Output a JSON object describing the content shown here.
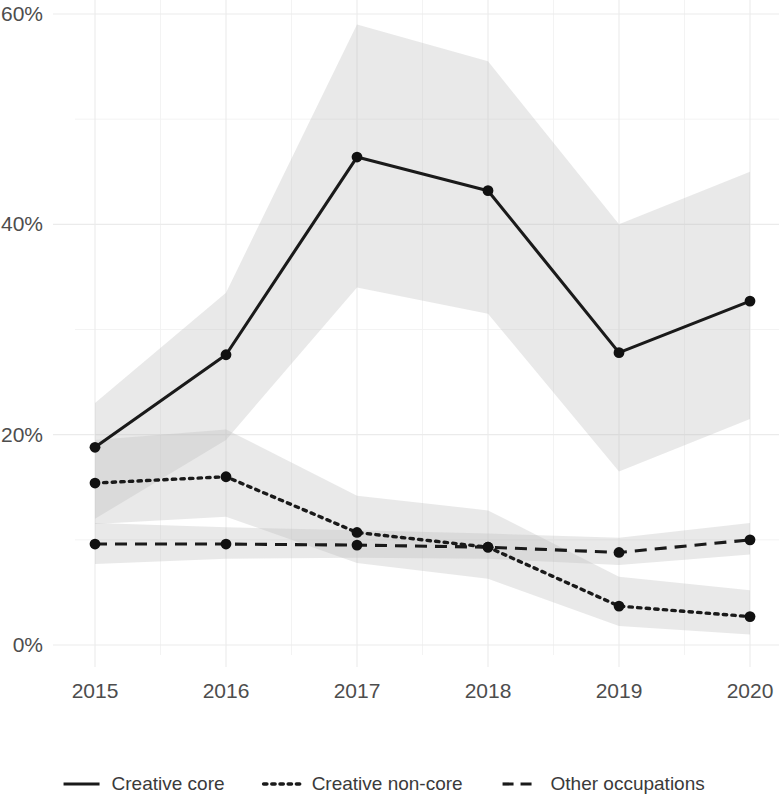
{
  "chart_data": {
    "type": "line",
    "title": "",
    "subtitle": "",
    "xlabel": "",
    "ylabel": "",
    "categories": [
      "2015",
      "2016",
      "2017",
      "2018",
      "2019",
      "2020"
    ],
    "x": [
      2015,
      2016,
      2017,
      2018,
      2019,
      2020
    ],
    "ylim": [
      0,
      60
    ],
    "ytick_labels": [
      "0%",
      "20%",
      "40%",
      "60%"
    ],
    "ytick_values": [
      0,
      20,
      40,
      60
    ],
    "xtick_labels": [
      "2015",
      "2016",
      "2017",
      "2018",
      "2019",
      "2020"
    ],
    "grid": true,
    "grid_minor": true,
    "legend_position": "bottom",
    "value_unit": "percent",
    "series": [
      {
        "name": "Creative core",
        "style": "solid",
        "color": "#1a1a1a",
        "markers": true,
        "values": [
          18.8,
          27.6,
          46.4,
          43.2,
          27.8,
          32.7
        ],
        "band_lower": [
          12.0,
          19.5,
          34.0,
          31.5,
          16.5,
          21.5
        ],
        "band_upper": [
          23.0,
          33.5,
          59.0,
          55.5,
          40.0,
          45.0
        ],
        "band_label": "confidence interval"
      },
      {
        "name": "Creative non-core",
        "style": "dotted",
        "color": "#1a1a1a",
        "markers": true,
        "values": [
          15.4,
          16.0,
          10.7,
          9.3,
          3.7,
          2.7
        ],
        "band_lower": [
          11.5,
          12.2,
          7.8,
          6.3,
          1.8,
          1.0
        ],
        "band_upper": [
          19.5,
          20.5,
          14.2,
          12.8,
          6.5,
          5.2
        ],
        "band_label": "confidence interval"
      },
      {
        "name": "Other occupations",
        "style": "dashed",
        "color": "#1a1a1a",
        "markers": true,
        "values": [
          9.6,
          9.6,
          9.5,
          9.3,
          8.8,
          10.0
        ],
        "band_lower": [
          7.7,
          8.2,
          8.3,
          8.2,
          7.6,
          8.6
        ],
        "band_upper": [
          11.6,
          11.2,
          10.9,
          10.6,
          10.2,
          11.6
        ],
        "band_label": "confidence interval"
      }
    ]
  },
  "legend": {
    "items": [
      {
        "label": "Creative core",
        "style": "solid"
      },
      {
        "label": "Creative non-core",
        "style": "dotted"
      },
      {
        "label": "Other occupations",
        "style": "dashed"
      }
    ]
  },
  "axes": {
    "y_ticks": [
      {
        "label": "60%",
        "value": 60
      },
      {
        "label": "40%",
        "value": 40
      },
      {
        "label": "20%",
        "value": 20
      },
      {
        "label": "0%",
        "value": 0
      }
    ],
    "x_ticks": [
      {
        "label": "2015",
        "value": 2015
      },
      {
        "label": "2016",
        "value": 2016
      },
      {
        "label": "2017",
        "value": 2017
      },
      {
        "label": "2018",
        "value": 2018
      },
      {
        "label": "2019",
        "value": 2019
      },
      {
        "label": "2020",
        "value": 2020
      }
    ]
  },
  "colors": {
    "line": "#1a1a1a",
    "band": "#bdbdbd",
    "grid_major": "#ebebeb",
    "grid_minor": "#f2f2f2",
    "text": "#4d4d4d",
    "background": "#ffffff"
  }
}
